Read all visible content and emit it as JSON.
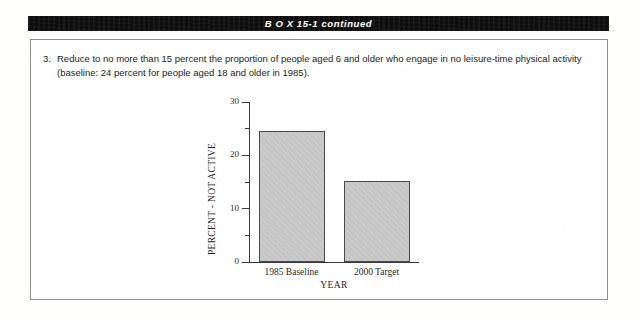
{
  "header": {
    "title": "B O X  15-1 continued"
  },
  "goal": {
    "number": "3.",
    "text": "Reduce to no more than 15 percent the proportion of people aged 6 and older who engage in no leisure-time physical activity (baseline: 24 percent for people aged 18 and older in 1985)."
  },
  "chart_data": {
    "type": "bar",
    "title": "",
    "categories": [
      "1985 Baseline",
      "2000 Target"
    ],
    "values": [
      24.5,
      15.1
    ],
    "xlabel": "YEAR",
    "ylabel": "PERCENT - NOT ACTIVE",
    "ylim": [
      0,
      30
    ],
    "yticks": [
      0,
      10,
      20,
      30
    ],
    "ytick_labels": [
      "0",
      "10",
      "20",
      "30"
    ],
    "yminor_ticks": [
      5,
      15,
      25
    ],
    "grid": false,
    "legend": false,
    "bar_fill_color": "#c9c9c9",
    "bar_edge_color": "#4a4a4a"
  },
  "colors": {
    "header_bar": "#0d0d0d",
    "header_text": "#ffffff",
    "box_border": "#8d8f8d",
    "body_text": "#1c1c1c"
  }
}
